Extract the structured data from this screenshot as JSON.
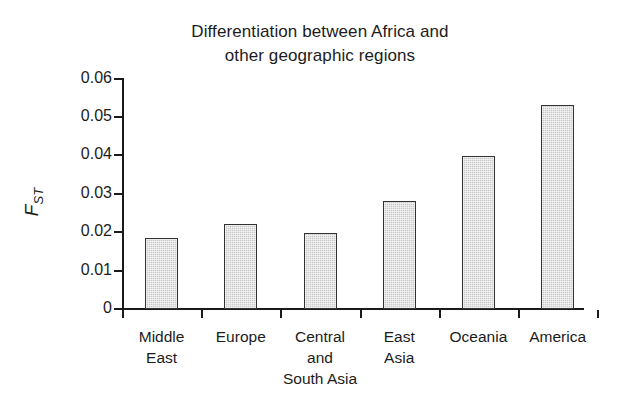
{
  "chart_data": {
    "type": "bar",
    "title": "Differentiation between Africa and other geographic regions",
    "title_lines": [
      "Differentiation between Africa and",
      "other geographic regions"
    ],
    "xlabel": "",
    "ylabel": "F_ST",
    "ylabel_base": "F",
    "ylabel_sub": "ST",
    "categories": [
      "Middle East",
      "Europe",
      "Central and South Asia",
      "East Asia",
      "Oceania",
      "America"
    ],
    "category_lines": [
      [
        "Middle",
        "East"
      ],
      [
        "Europe"
      ],
      [
        "Central",
        "and",
        "South Asia"
      ],
      [
        "East",
        "Asia"
      ],
      [
        "Oceania"
      ],
      [
        "America"
      ]
    ],
    "values": [
      0.0185,
      0.022,
      0.0199,
      0.0282,
      0.0397,
      0.053
    ],
    "ylim": [
      0,
      0.06
    ],
    "ytick_values": [
      0,
      0.01,
      0.02,
      0.03,
      0.04,
      0.05,
      0.06
    ],
    "ytick_labels": [
      "0",
      "0.01",
      "0.02",
      "0.03",
      "0.04",
      "0.05",
      "0.06"
    ],
    "grid": false,
    "legend": null,
    "bar_fill_color": "#c9c9c9",
    "bar_border_color": "#333333",
    "axis_color": "#1a1a1a",
    "text_color": "#1c1c1c",
    "background_color": "#ffffff"
  }
}
